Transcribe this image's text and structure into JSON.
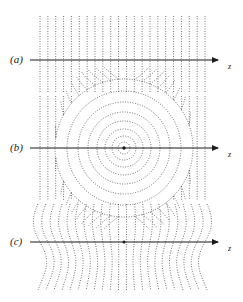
{
  "figure": {
    "width": 243,
    "height": 302,
    "background": "#ffffff",
    "line_color": "#4a4a4a",
    "axis_color": "#1a1a1a",
    "panels": [
      {
        "id": "a",
        "label": "(a)",
        "axis_label": "z",
        "axis_y": 60,
        "axis_x_start": 30,
        "axis_x_end": 218,
        "label_x": 10,
        "label_y": 53,
        "axis_label_x": 228,
        "axis_label_y": 62,
        "field_type": "uniform-vertical",
        "description": "Straight vertical field lines, undisturbed uniform field"
      },
      {
        "id": "b",
        "label": "(b)",
        "axis_label": "z",
        "axis_y": 148,
        "axis_x_start": 30,
        "axis_x_end": 218,
        "label_x": 10,
        "label_y": 141,
        "axis_label_x": 228,
        "axis_label_y": 150,
        "field_type": "concentric-circles",
        "center_x": 124,
        "center_y": 148,
        "circle_radii": [
          6,
          12,
          19,
          27,
          36,
          46,
          57,
          69
        ],
        "description": "Concentric circular field lines centred on a point source with outer vertical lines"
      },
      {
        "id": "c",
        "label": "(c)",
        "axis_label": "z",
        "axis_y": 242,
        "axis_x_start": 30,
        "axis_x_end": 218,
        "label_x": 10,
        "label_y": 235,
        "axis_label_x": 228,
        "axis_label_y": 244,
        "field_type": "perturbed-vertical",
        "center_x": 124,
        "center_y": 242,
        "description": "Vertical field lines with wavy kink perturbation"
      }
    ],
    "grid": {
      "n_lines": 22,
      "x_start": 40,
      "x_end": 205,
      "y_top": 16,
      "y_bottom": 290
    },
    "chart_data": {
      "type": "line",
      "title": "",
      "xlabel": "z",
      "ylabel": "",
      "series": [
        {
          "name": "(a) uniform field lines",
          "values": []
        },
        {
          "name": "(b) concentric circular field lines",
          "values": []
        },
        {
          "name": "(c) perturbed field lines",
          "values": []
        }
      ]
    }
  }
}
